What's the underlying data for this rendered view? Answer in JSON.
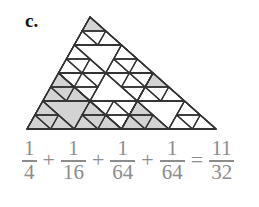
{
  "label": "c.",
  "colors": {
    "shade": "#d3d3d3",
    "stroke": "#333333",
    "equation": "#8c8c8c"
  },
  "triangle": {
    "vertices": [
      [
        90,
        17
      ],
      [
        27,
        129
      ],
      [
        216,
        129
      ]
    ],
    "shaded_regions": [
      {
        "path": [
          1
        ],
        "fraction": "1/4"
      },
      {
        "path": [
          2,
          1
        ],
        "fraction": "1/16"
      },
      {
        "path": [
          0,
          0,
          0
        ],
        "fraction": "1/64"
      },
      {
        "path": [
          2,
          0,
          0
        ],
        "fraction": "1/64"
      }
    ]
  },
  "equation": {
    "terms": [
      {
        "num": "1",
        "den": "4"
      },
      {
        "op": "+"
      },
      {
        "num": "1",
        "den": "16"
      },
      {
        "op": "+"
      },
      {
        "num": "1",
        "den": "64"
      },
      {
        "op": "+"
      },
      {
        "num": "1",
        "den": "64"
      },
      {
        "op": "="
      },
      {
        "num": "11",
        "den": "32"
      }
    ]
  }
}
